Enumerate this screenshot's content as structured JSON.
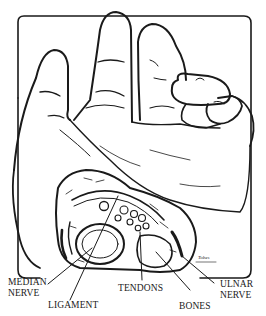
{
  "figure": {
    "labels": {
      "median_nerve": [
        "MEDIAN",
        "NERVE"
      ],
      "ligament": "LIGAMENT",
      "tendons": "TENDONS",
      "bones": "BONES",
      "ulnar_nerve": [
        "ULNAR",
        "NERVE"
      ]
    },
    "signature": "Tobes",
    "colors": {
      "ink": "#1a1a1a",
      "paper": "#ffffff"
    }
  }
}
